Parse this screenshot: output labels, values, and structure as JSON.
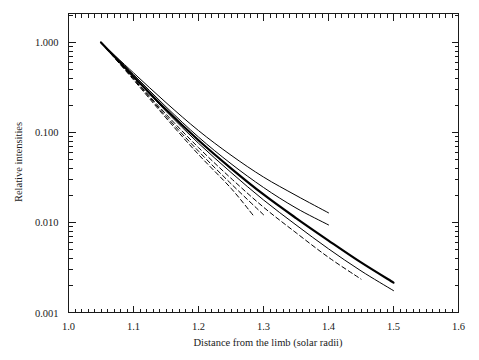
{
  "figure": {
    "background_color": "#ffffff",
    "foreground_color": "#1a1a1a"
  },
  "axes": {
    "x_title": "Distance from the limb (solar radii)",
    "y_title": "Relative intensities",
    "x_tick_labels": [
      "1.0",
      "1.1",
      "1.2",
      "1.3",
      "1.4",
      "1.5",
      "1.6"
    ],
    "y_tick_labels": [
      "1.000",
      "0.100",
      "0.010",
      "0.001"
    ]
  },
  "chart_data": {
    "type": "line",
    "title": "",
    "xlabel": "Distance from the limb (solar radii)",
    "ylabel": "Relative intensities",
    "xlim": [
      1.0,
      1.6
    ],
    "ylim": [
      0.001,
      2.1
    ],
    "yscale": "log",
    "xscale": "linear",
    "grid": false,
    "legend": "none",
    "xticks": [
      1.0,
      1.1,
      1.2,
      1.3,
      1.4,
      1.5,
      1.6
    ],
    "yticks": [
      0.001,
      0.01,
      0.1,
      1.0
    ],
    "x_minor_ticks_per_interval": 10,
    "series": [
      {
        "name": "solid-upper",
        "style": "solid",
        "width": 1.0,
        "color": "#000000",
        "x": [
          1.05,
          1.1,
          1.15,
          1.2,
          1.25,
          1.3,
          1.35,
          1.4
        ],
        "y": [
          1.0,
          0.46,
          0.215,
          0.105,
          0.056,
          0.032,
          0.02,
          0.0128
        ]
      },
      {
        "name": "solid-thick-middle",
        "style": "solid",
        "width": 2.2,
        "color": "#000000",
        "x": [
          1.05,
          1.1,
          1.15,
          1.2,
          1.25,
          1.3,
          1.35,
          1.4,
          1.45,
          1.5
        ],
        "y": [
          1.0,
          0.42,
          0.18,
          0.082,
          0.04,
          0.0205,
          0.0112,
          0.0063,
          0.0036,
          0.00215
        ]
      },
      {
        "name": "solid-lower",
        "style": "solid",
        "width": 1.0,
        "color": "#000000",
        "x": [
          1.05,
          1.1,
          1.15,
          1.2,
          1.25,
          1.3,
          1.35,
          1.4,
          1.45,
          1.5
        ],
        "y": [
          1.0,
          0.415,
          0.172,
          0.076,
          0.036,
          0.0178,
          0.0094,
          0.0051,
          0.0029,
          0.00175
        ]
      },
      {
        "name": "solid-short",
        "style": "solid",
        "width": 1.0,
        "color": "#000000",
        "x": [
          1.05,
          1.1,
          1.15,
          1.2,
          1.25,
          1.3,
          1.35,
          1.4
        ],
        "y": [
          1.0,
          0.44,
          0.193,
          0.089,
          0.045,
          0.0245,
          0.0145,
          0.0094
        ]
      },
      {
        "name": "dashed-upper",
        "style": "dashed",
        "width": 1.0,
        "color": "#000000",
        "x": [
          1.05,
          1.1,
          1.15,
          1.2,
          1.25,
          1.3,
          1.35,
          1.4,
          1.45
        ],
        "y": [
          1.0,
          0.4,
          0.16,
          0.068,
          0.031,
          0.0148,
          0.0077,
          0.0041,
          0.00235
        ]
      },
      {
        "name": "dashed-middle",
        "style": "dashed",
        "width": 1.0,
        "color": "#000000",
        "x": [
          1.05,
          1.1,
          1.15,
          1.2,
          1.25,
          1.3
        ],
        "y": [
          1.0,
          0.395,
          0.152,
          0.062,
          0.027,
          0.0122
        ]
      },
      {
        "name": "dashed-lower",
        "style": "dashed",
        "width": 1.0,
        "color": "#000000",
        "x": [
          1.05,
          1.1,
          1.15,
          1.2,
          1.25,
          1.285
        ],
        "y": [
          1.0,
          0.385,
          0.145,
          0.057,
          0.024,
          0.0118
        ]
      }
    ]
  }
}
